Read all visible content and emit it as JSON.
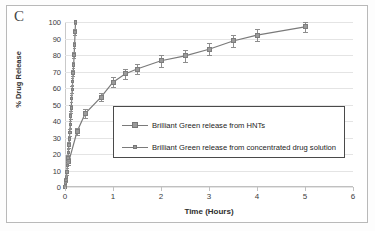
{
  "figure": {
    "panel_label": "C"
  },
  "chart_data": {
    "type": "line",
    "title": "",
    "subtitle": "",
    "xlabel": "Time (Hours)",
    "ylabel": "% Drug Release",
    "xlim": [
      0,
      6
    ],
    "ylim": [
      0,
      100
    ],
    "xticks": [
      0,
      1,
      2,
      3,
      4,
      5,
      6
    ],
    "yticks": [
      0,
      10,
      20,
      30,
      40,
      50,
      60,
      70,
      80,
      90,
      100
    ],
    "grid": true,
    "legend_position": "inside-lower-center",
    "marker_color": "#9a9a9a",
    "line_color": "#7a7a7a",
    "errorbar_color": "#8e8e8e",
    "series": [
      {
        "name": "Brilliant Green release from HNTs",
        "x": [
          0.08,
          0.25,
          0.42,
          0.75,
          1.0,
          1.25,
          1.5,
          2.0,
          2.5,
          3.0,
          3.5,
          4.0,
          5.0
        ],
        "values": [
          15.5,
          33.5,
          44.5,
          54.5,
          63.5,
          68.5,
          71.5,
          76.5,
          79.5,
          83.5,
          88.5,
          92.0,
          97.0
        ],
        "error": [
          2.0,
          2.0,
          2.5,
          2.5,
          3.0,
          3.0,
          3.0,
          3.5,
          3.5,
          3.5,
          3.5,
          3.5,
          3.0
        ]
      },
      {
        "name": "Brilliant Green release from concentrated drug solution",
        "x": [
          0.0,
          0.01,
          0.02,
          0.03,
          0.04,
          0.05,
          0.06,
          0.07,
          0.08,
          0.09,
          0.1,
          0.11,
          0.12,
          0.13,
          0.14,
          0.15,
          0.16,
          0.17,
          0.18,
          0.19,
          0.2,
          0.21,
          0.22
        ],
        "values": [
          0.0,
          2.0,
          4.0,
          6.0,
          9.0,
          13.0,
          17.5,
          21.0,
          25.5,
          29.0,
          33.0,
          38.0,
          43.0,
          48.0,
          53.5,
          59.0,
          64.0,
          69.0,
          74.0,
          80.0,
          86.0,
          94.0,
          100.0
        ],
        "error": [
          1.0,
          1.0,
          1.2,
          1.2,
          1.5,
          1.5,
          1.8,
          1.8,
          2.0,
          2.0,
          2.0,
          2.0,
          2.0,
          2.0,
          2.0,
          2.0,
          2.0,
          2.0,
          2.0,
          2.0,
          2.0,
          2.0,
          1.5
        ]
      }
    ]
  },
  "legend": {
    "items": [
      {
        "label": "Brilliant Green release from HNTs"
      },
      {
        "label": "Brilliant Green release from concentrated drug solution"
      }
    ]
  }
}
